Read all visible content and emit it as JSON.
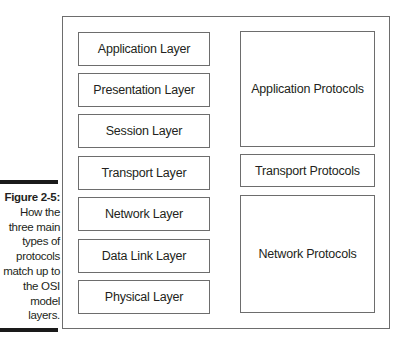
{
  "figure": {
    "title": "Figure 2-5:",
    "caption_lines": [
      "How the",
      "three main",
      "types of",
      "protocols",
      "match up to",
      "the OSI",
      "model",
      "layers."
    ]
  },
  "osi_layers": [
    {
      "label": "Application Layer",
      "top": 32
    },
    {
      "label": "Presentation Layer",
      "top": 73
    },
    {
      "label": "Session Layer",
      "top": 114
    },
    {
      "label": "Transport Layer",
      "top": 156
    },
    {
      "label": "Network Layer",
      "top": 197
    },
    {
      "label": "Data Link Layer",
      "top": 239
    },
    {
      "label": "Physical Layer",
      "top": 280
    }
  ],
  "protocol_groups": [
    {
      "label": "Application Protocols",
      "top": 31,
      "height": 116
    },
    {
      "label": "Transport Protocols",
      "top": 154,
      "height": 33
    },
    {
      "label": "Network Protocols",
      "top": 195,
      "height": 118
    }
  ]
}
